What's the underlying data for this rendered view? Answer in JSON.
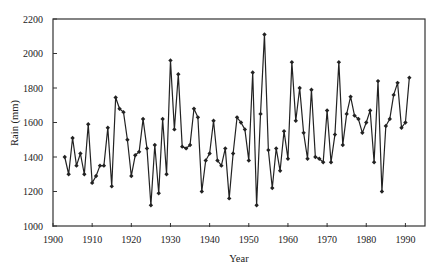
{
  "chart_data": {
    "type": "line",
    "title": "",
    "xlabel": "Year",
    "ylabel": "Rain (mm)",
    "xlim": [
      1900,
      1995
    ],
    "ylim": [
      1000,
      2200
    ],
    "xticks": [
      1900,
      1910,
      1920,
      1930,
      1940,
      1950,
      1960,
      1970,
      1980,
      1990
    ],
    "yticks": [
      1000,
      1200,
      1400,
      1600,
      1800,
      2000,
      2200
    ],
    "grid": false,
    "legend": null,
    "marker": "diamond",
    "line_color": "#222222",
    "x": [
      1903,
      1904,
      1905,
      1906,
      1907,
      1908,
      1909,
      1910,
      1911,
      1912,
      1913,
      1914,
      1915,
      1916,
      1917,
      1918,
      1919,
      1920,
      1921,
      1922,
      1923,
      1924,
      1925,
      1926,
      1927,
      1928,
      1929,
      1930,
      1931,
      1932,
      1933,
      1934,
      1935,
      1936,
      1937,
      1938,
      1939,
      1940,
      1941,
      1942,
      1943,
      1944,
      1945,
      1946,
      1947,
      1948,
      1949,
      1950,
      1951,
      1952,
      1953,
      1954,
      1955,
      1956,
      1957,
      1958,
      1959,
      1960,
      1961,
      1962,
      1963,
      1964,
      1965,
      1966,
      1967,
      1968,
      1969,
      1970,
      1971,
      1972,
      1973,
      1974,
      1975,
      1976,
      1977,
      1978,
      1979,
      1980,
      1981,
      1982,
      1983,
      1984,
      1985,
      1986,
      1987,
      1988,
      1989,
      1990,
      1991
    ],
    "series": [
      {
        "name": "Rain (mm)",
        "values": [
          1400,
          1300,
          1510,
          1350,
          1420,
          1300,
          1590,
          1250,
          1290,
          1350,
          1350,
          1570,
          1230,
          1745,
          1680,
          1660,
          1500,
          1290,
          1410,
          1430,
          1620,
          1450,
          1120,
          1470,
          1190,
          1620,
          1300,
          1960,
          1560,
          1880,
          1460,
          1450,
          1470,
          1680,
          1630,
          1200,
          1380,
          1420,
          1610,
          1380,
          1350,
          1450,
          1160,
          1420,
          1630,
          1600,
          1560,
          1380,
          1890,
          1120,
          1650,
          2110,
          1440,
          1220,
          1450,
          1320,
          1550,
          1390,
          1950,
          1610,
          1800,
          1540,
          1390,
          1790,
          1400,
          1390,
          1370,
          1670,
          1370,
          1530,
          1950,
          1470,
          1650,
          1750,
          1640,
          1620,
          1540,
          1600,
          1670,
          1370,
          1840,
          1200,
          1580,
          1620,
          1760,
          1830,
          1570,
          1600,
          1860
        ]
      }
    ]
  }
}
